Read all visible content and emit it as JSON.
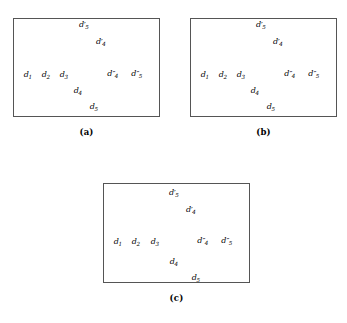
{
  "figure": {
    "width": 347,
    "height": 323,
    "background": "#ffffff",
    "ink_color": "#000000",
    "box_border_color": "#555555"
  },
  "panels": [
    {
      "id": "a",
      "caption": "(a)",
      "box": {
        "x": 13,
        "y": 18,
        "w": 147,
        "h": 99
      },
      "caption_y": 127,
      "nodes": [
        {
          "id": "d1",
          "base": "d",
          "sub": "1",
          "prime": "",
          "cx": 28,
          "cy": 66,
          "label_x": 28,
          "label_y": 71,
          "label_align": "center"
        },
        {
          "id": "d2",
          "base": "d",
          "sub": "2",
          "prime": "",
          "cx": 46,
          "cy": 64,
          "label_x": 46,
          "label_y": 71,
          "label_align": "center"
        },
        {
          "id": "d3",
          "base": "d",
          "sub": "3",
          "prime": "",
          "cx": 64,
          "cy": 65,
          "label_x": 64,
          "label_y": 71,
          "label_align": "center"
        },
        {
          "id": "d4",
          "base": "d",
          "sub": "4",
          "prime": "",
          "cx": 83,
          "cy": 80,
          "label_x": 78,
          "label_y": 87,
          "label_align": "center"
        },
        {
          "id": "d5",
          "base": "d",
          "sub": "5",
          "prime": "",
          "cx": 98,
          "cy": 97,
          "label_x": 94,
          "label_y": 103,
          "label_align": "center"
        },
        {
          "id": "d4p",
          "base": "d",
          "sub": "4",
          "prime": "′",
          "cx": 92,
          "cy": 46,
          "label_x": 101,
          "label_y": 38,
          "label_align": "center"
        },
        {
          "id": "d5p",
          "base": "d",
          "sub": "5",
          "prime": "′",
          "cx": 75,
          "cy": 31,
          "label_x": 84,
          "label_y": 21,
          "label_align": "center"
        },
        {
          "id": "d4pp",
          "base": "d",
          "sub": "4",
          "prime": "″",
          "cx": 110,
          "cy": 63,
          "label_x": 113,
          "label_y": 70,
          "label_align": "center"
        },
        {
          "id": "d5pp",
          "base": "d",
          "sub": "5",
          "prime": "″",
          "cx": 127,
          "cy": 61,
          "label_x": 137,
          "label_y": 70,
          "label_align": "center"
        }
      ],
      "edges": []
    },
    {
      "id": "b",
      "caption": "(b)",
      "box": {
        "x": 190,
        "y": 18,
        "w": 147,
        "h": 99
      },
      "caption_y": 127,
      "nodes": [
        {
          "id": "d1",
          "base": "d",
          "sub": "1",
          "prime": "",
          "cx": 205,
          "cy": 66,
          "label_x": 205,
          "label_y": 71,
          "label_align": "center"
        },
        {
          "id": "d2",
          "base": "d",
          "sub": "2",
          "prime": "",
          "cx": 223,
          "cy": 64,
          "label_x": 223,
          "label_y": 71,
          "label_align": "center"
        },
        {
          "id": "d3",
          "base": "d",
          "sub": "3",
          "prime": "",
          "cx": 241,
          "cy": 65,
          "label_x": 241,
          "label_y": 71,
          "label_align": "center"
        },
        {
          "id": "d4",
          "base": "d",
          "sub": "4",
          "prime": "",
          "cx": 260,
          "cy": 80,
          "label_x": 255,
          "label_y": 87,
          "label_align": "center"
        },
        {
          "id": "d5",
          "base": "d",
          "sub": "5",
          "prime": "",
          "cx": 275,
          "cy": 97,
          "label_x": 271,
          "label_y": 103,
          "label_align": "center"
        },
        {
          "id": "d4p",
          "base": "d",
          "sub": "4",
          "prime": "′",
          "cx": 269,
          "cy": 46,
          "label_x": 278,
          "label_y": 38,
          "label_align": "center"
        },
        {
          "id": "d5p",
          "base": "d",
          "sub": "5",
          "prime": "′",
          "cx": 252,
          "cy": 31,
          "label_x": 261,
          "label_y": 21,
          "label_align": "center"
        },
        {
          "id": "d4pp",
          "base": "d",
          "sub": "4",
          "prime": "″",
          "cx": 287,
          "cy": 63,
          "label_x": 290,
          "label_y": 70,
          "label_align": "center"
        },
        {
          "id": "d5pp",
          "base": "d",
          "sub": "5",
          "prime": "″",
          "cx": 304,
          "cy": 61,
          "label_x": 314,
          "label_y": 70,
          "label_align": "center"
        }
      ],
      "edges": [
        {
          "from": "d5p",
          "to": "d4p"
        },
        {
          "from": "d1",
          "to": "d2"
        },
        {
          "from": "d2",
          "to": "d3"
        },
        {
          "from": "d4",
          "to": "d5"
        },
        {
          "from": "d4pp",
          "to": "d5pp"
        }
      ]
    },
    {
      "id": "c",
      "caption": "(c)",
      "box": {
        "x": 103,
        "y": 183,
        "w": 147,
        "h": 100
      },
      "caption_y": 293,
      "nodes": [
        {
          "id": "d1",
          "base": "d",
          "sub": "1",
          "prime": "",
          "cx": 118,
          "cy": 232,
          "label_x": 118,
          "label_y": 238,
          "label_align": "center"
        },
        {
          "id": "d2",
          "base": "d",
          "sub": "2",
          "prime": "",
          "cx": 136,
          "cy": 230,
          "label_x": 136,
          "label_y": 238,
          "label_align": "center"
        },
        {
          "id": "d3",
          "base": "d",
          "sub": "3",
          "prime": "",
          "cx": 155,
          "cy": 231,
          "label_x": 155,
          "label_y": 238,
          "label_align": "center"
        },
        {
          "id": "d4",
          "base": "d",
          "sub": "4",
          "prime": "",
          "cx": 182,
          "cy": 251,
          "label_x": 174,
          "label_y": 258,
          "label_align": "center"
        },
        {
          "id": "d5",
          "base": "d",
          "sub": "5",
          "prime": "",
          "cx": 201,
          "cy": 268,
          "label_x": 196,
          "label_y": 274,
          "label_align": "center"
        },
        {
          "id": "d4p",
          "base": "d",
          "sub": "4",
          "prime": "′",
          "cx": 182,
          "cy": 215,
          "label_x": 191,
          "label_y": 206,
          "label_align": "center"
        },
        {
          "id": "d5p",
          "base": "d",
          "sub": "5",
          "prime": "′",
          "cx": 165,
          "cy": 199,
          "label_x": 174,
          "label_y": 189,
          "label_align": "center"
        },
        {
          "id": "d4pp",
          "base": "d",
          "sub": "4",
          "prime": "″",
          "cx": 200,
          "cy": 230,
          "label_x": 203,
          "label_y": 237,
          "label_align": "center"
        },
        {
          "id": "d5pp",
          "base": "d",
          "sub": "5",
          "prime": "″",
          "cx": 217,
          "cy": 228,
          "label_x": 227,
          "label_y": 237,
          "label_align": "center"
        }
      ],
      "edges": [
        {
          "from": "d5p",
          "to": "d4p"
        },
        {
          "from": "d1",
          "to": "d2"
        },
        {
          "from": "d2",
          "to": "d3"
        },
        {
          "from": "d3",
          "to": "d4"
        },
        {
          "from": "d4",
          "to": "d5"
        },
        {
          "from": "d4pp",
          "to": "d5pp"
        }
      ]
    }
  ],
  "node_radius": 3.1
}
